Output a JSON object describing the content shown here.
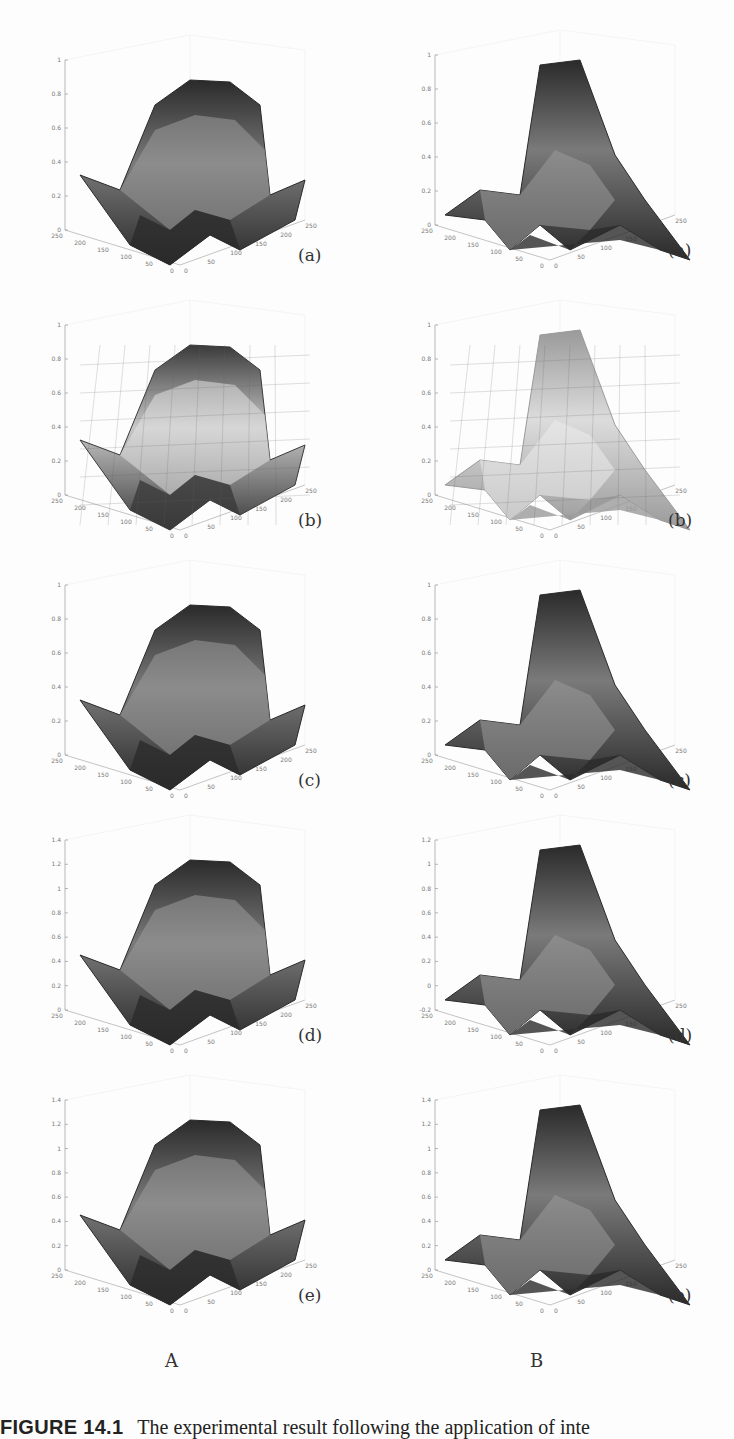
{
  "caption": {
    "label": "FIGURE 14.1",
    "text": "The experimental result following the application of inte"
  },
  "columns": [
    {
      "label": "A"
    },
    {
      "label": "B"
    }
  ],
  "chart_data": [
    {
      "type": "surface3d",
      "column": "A",
      "panel": "(a)",
      "title": "",
      "zlim": [
        0,
        1
      ],
      "zticks": [
        "0",
        "0.2",
        "0.4",
        "0.6",
        "0.8",
        "1"
      ],
      "xticks": [
        "0",
        "50",
        "100",
        "150",
        "200",
        "250"
      ],
      "yticks": [
        "0",
        "50",
        "100",
        "150",
        "200",
        "250"
      ],
      "style": "dense dark-shaded mesh",
      "description": "Ridge-shaped surface, peak ~0.95 at back center, corners ~0.5–0.6, deep valleys at front"
    },
    {
      "type": "surface3d",
      "column": "B",
      "panel": "(a)",
      "title": "",
      "zlim": [
        0,
        1
      ],
      "zticks": [
        "0",
        "0.2",
        "0.4",
        "0.6",
        "0.8",
        "1"
      ],
      "xticks": [
        "0",
        "50",
        "100",
        "150",
        "200",
        "250"
      ],
      "yticks": [
        "0",
        "50",
        "100",
        "150",
        "200",
        "250"
      ],
      "style": "dense dark-shaded mesh",
      "description": "Single dominant peak ~1.0 at back, secondary ridge ~0.6, tapering to 0 at right corner"
    },
    {
      "type": "surface3d",
      "column": "A",
      "panel": "(b)",
      "title": "",
      "zlim": [
        0,
        1
      ],
      "zticks": [
        "0",
        "0.2",
        "0.4",
        "0.6",
        "0.8",
        "1"
      ],
      "xticks": [
        "0",
        "50",
        "100",
        "150",
        "200",
        "250"
      ],
      "yticks": [
        "0",
        "50",
        "100",
        "150",
        "200",
        "250"
      ],
      "style": "coarse faceted, colormap bands",
      "description": "Coarse grid approximation of (a); peak ~0.95"
    },
    {
      "type": "surface3d",
      "column": "B",
      "panel": "(b)",
      "title": "",
      "zlim": [
        0,
        1
      ],
      "zticks": [
        "0",
        "0.2",
        "0.4",
        "0.6",
        "0.8",
        "1"
      ],
      "xticks": [
        "0",
        "50",
        "100",
        "150",
        "200",
        "250"
      ],
      "yticks": [
        "0",
        "50",
        "100",
        "150",
        "200",
        "250"
      ],
      "style": "coarse faceted, light gray",
      "description": "Coarse grid approximation of (a); peak ~1.0"
    },
    {
      "type": "surface3d",
      "column": "A",
      "panel": "(c)",
      "title": "",
      "zlim": [
        0,
        1
      ],
      "zticks": [
        "0",
        "0.2",
        "0.4",
        "0.6",
        "0.8",
        "1"
      ],
      "xticks": [
        "0",
        "50",
        "100",
        "150",
        "200",
        "250"
      ],
      "yticks": [
        "0",
        "50",
        "100",
        "150",
        "200",
        "250"
      ],
      "style": "smooth shaded",
      "description": "Smoothed reconstruction, peak ~0.95"
    },
    {
      "type": "surface3d",
      "column": "B",
      "panel": "(c)",
      "title": "",
      "zlim": [
        0,
        1
      ],
      "zticks": [
        "0",
        "0.2",
        "0.4",
        "0.6",
        "0.8",
        "1"
      ],
      "xticks": [
        "0",
        "50",
        "100",
        "150",
        "200",
        "250"
      ],
      "yticks": [
        "0",
        "50",
        "100",
        "150",
        "200",
        "250"
      ],
      "style": "smooth shaded",
      "description": "Reconstruction, peak ~1.0"
    },
    {
      "type": "surface3d",
      "column": "A",
      "panel": "(d)",
      "title": "",
      "zlim": [
        0,
        1.4
      ],
      "zticks": [
        "0",
        "0.2",
        "0.4",
        "0.6",
        "0.8",
        "1",
        "1.2",
        "1.4"
      ],
      "xticks": [
        "0",
        "50",
        "100",
        "150",
        "200",
        "250"
      ],
      "yticks": [
        "0",
        "50",
        "100",
        "150",
        "200",
        "250"
      ],
      "style": "smooth shaded, wavy",
      "description": "Reconstruction with overshoot ripples, peak ~1.0"
    },
    {
      "type": "surface3d",
      "column": "B",
      "panel": "(d)",
      "title": "",
      "zlim": [
        -0.2,
        1.2
      ],
      "zticks": [
        "-0.2",
        "0",
        "0.2",
        "0.4",
        "0.6",
        "0.8",
        "1",
        "1.2"
      ],
      "xticks": [
        "0",
        "50",
        "100",
        "150",
        "200",
        "250"
      ],
      "yticks": [
        "0",
        "50",
        "100",
        "150",
        "200",
        "250"
      ],
      "style": "smooth shaded, wavy",
      "description": "Reconstruction with ripples, peak ~1.1"
    },
    {
      "type": "surface3d",
      "column": "A",
      "panel": "(e)",
      "title": "",
      "zlim": [
        0,
        1.4
      ],
      "zticks": [
        "0",
        "0.2",
        "0.4",
        "0.6",
        "0.8",
        "1",
        "1.2",
        "1.4"
      ],
      "xticks": [
        "0",
        "50",
        "100",
        "150",
        "200",
        "250"
      ],
      "yticks": [
        "0",
        "50",
        "100",
        "150",
        "200",
        "250"
      ],
      "style": "smooth shaded",
      "description": "Smooth reconstruction, peak ~1.0"
    },
    {
      "type": "surface3d",
      "column": "B",
      "panel": "(e)",
      "title": "",
      "zlim": [
        0,
        1.4
      ],
      "zticks": [
        "0",
        "0.2",
        "0.4",
        "0.6",
        "0.8",
        "1",
        "1.2",
        "1.4"
      ],
      "xticks": [
        "0",
        "50",
        "100",
        "150",
        "200",
        "250"
      ],
      "yticks": [
        "0",
        "50",
        "100",
        "150",
        "200",
        "250"
      ],
      "style": "smooth shaded",
      "description": "Smooth reconstruction, peak ~1.25"
    }
  ],
  "panels": {
    "A": [
      {
        "label": "(a)",
        "zticks": [
          "0",
          "0.2",
          "0.4",
          "0.6",
          "0.8",
          "1"
        ]
      },
      {
        "label": "(b)",
        "zticks": [
          "0",
          "0.2",
          "0.4",
          "0.6",
          "0.8",
          "1"
        ]
      },
      {
        "label": "(c)",
        "zticks": [
          "0",
          "0.2",
          "0.4",
          "0.6",
          "0.8",
          "1"
        ]
      },
      {
        "label": "(d)",
        "zticks": [
          "0",
          "0.2",
          "0.4",
          "0.6",
          "0.8",
          "1",
          "1.2",
          "1.4"
        ]
      },
      {
        "label": "(e)",
        "zticks": [
          "0",
          "0.2",
          "0.4",
          "0.6",
          "0.8",
          "1",
          "1.2",
          "1.4"
        ]
      }
    ],
    "B": [
      {
        "label": "(a)",
        "zticks": [
          "0",
          "0.2",
          "0.4",
          "0.6",
          "0.8",
          "1"
        ]
      },
      {
        "label": "(b)",
        "zticks": [
          "0",
          "0.2",
          "0.4",
          "0.6",
          "0.8",
          "1"
        ]
      },
      {
        "label": "(c)",
        "zticks": [
          "0",
          "0.2",
          "0.4",
          "0.6",
          "0.8",
          "1"
        ]
      },
      {
        "label": "(d)",
        "zticks": [
          "-0.2",
          "0",
          "0.2",
          "0.4",
          "0.6",
          "0.8",
          "1",
          "1.2"
        ]
      },
      {
        "label": "(e)",
        "zticks": [
          "0",
          "0.2",
          "0.4",
          "0.6",
          "0.8",
          "1",
          "1.2",
          "1.4"
        ]
      }
    ]
  },
  "axis_ticks": {
    "left": [
      "250",
      "200",
      "150",
      "100",
      "50",
      "0"
    ],
    "right": [
      "0",
      "50",
      "100",
      "150",
      "200",
      "250"
    ]
  }
}
